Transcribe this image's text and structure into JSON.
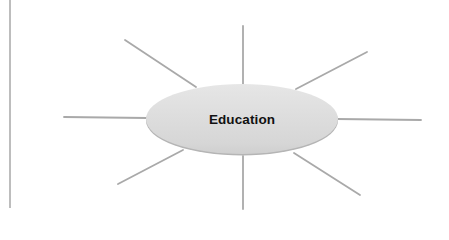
{
  "diagram": {
    "type": "spider-diagram",
    "center": {
      "label": "Education",
      "cx": 242,
      "cy": 119,
      "rx": 96,
      "ry": 35
    },
    "spokes": [
      {
        "name": "spoke-top",
        "x1": 243,
        "y1": 26,
        "x2": 243,
        "y2": 84
      },
      {
        "name": "spoke-top-left",
        "x1": 125,
        "y1": 40,
        "x2": 196,
        "y2": 87
      },
      {
        "name": "spoke-top-right",
        "x1": 367,
        "y1": 52,
        "x2": 296,
        "y2": 89
      },
      {
        "name": "spoke-left",
        "x1": 64,
        "y1": 117,
        "x2": 147,
        "y2": 118
      },
      {
        "name": "spoke-right",
        "x1": 337,
        "y1": 119,
        "x2": 421,
        "y2": 120
      },
      {
        "name": "spoke-bottom-left",
        "x1": 183,
        "y1": 150,
        "x2": 118,
        "y2": 184
      },
      {
        "name": "spoke-bottom",
        "x1": 243,
        "y1": 156,
        "x2": 243,
        "y2": 209
      },
      {
        "name": "spoke-bottom-right",
        "x1": 294,
        "y1": 153,
        "x2": 360,
        "y2": 195
      }
    ],
    "margin_rule": {
      "x": 10,
      "y1": 0,
      "y2": 208
    },
    "colors": {
      "spoke": "#a9a9a9",
      "ellipse_fill_top": "#e4e4e4",
      "ellipse_fill_bottom": "#d2d2d2",
      "ellipse_rim": "#b5b5b5",
      "margin_rule": "#9a9a9a",
      "label": "#111111"
    }
  }
}
